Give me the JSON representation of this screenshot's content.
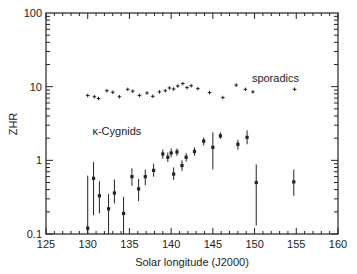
{
  "chart_data": {
    "type": "scatter",
    "title": "",
    "xlabel": "Solar longitude (J2000)",
    "ylabel": "ZHR",
    "xlim": [
      125,
      160
    ],
    "ylim": [
      0.1,
      100
    ],
    "yscale": "log",
    "x_ticks": [
      "125",
      "130",
      "135",
      "140",
      "145",
      "150",
      "155",
      "160"
    ],
    "y_ticks": [
      "0.1",
      "1",
      "10",
      "100"
    ],
    "grid": false,
    "legend": null,
    "annotations": [
      {
        "text": "sporadics",
        "x": 152.5,
        "y": 11.5
      },
      {
        "text": "κ-Cygnids",
        "x": 133.5,
        "y": 2.2
      }
    ],
    "series": [
      {
        "name": "sporadics",
        "marker": "plus",
        "points": [
          {
            "x": 130.0,
            "y": 7.6
          },
          {
            "x": 130.8,
            "y": 7.3
          },
          {
            "x": 131.3,
            "y": 6.9
          },
          {
            "x": 132.3,
            "y": 8.8
          },
          {
            "x": 133.0,
            "y": 8.4
          },
          {
            "x": 133.8,
            "y": 7.3
          },
          {
            "x": 134.8,
            "y": 9.2
          },
          {
            "x": 135.4,
            "y": 8.7
          },
          {
            "x": 136.2,
            "y": 7.6
          },
          {
            "x": 137.1,
            "y": 8.2
          },
          {
            "x": 137.8,
            "y": 7.4
          },
          {
            "x": 138.6,
            "y": 8.5
          },
          {
            "x": 139.3,
            "y": 8.8
          },
          {
            "x": 139.8,
            "y": 9.6
          },
          {
            "x": 140.3,
            "y": 9.3
          },
          {
            "x": 140.8,
            "y": 10.2
          },
          {
            "x": 141.4,
            "y": 11.0
          },
          {
            "x": 141.9,
            "y": 9.7
          },
          {
            "x": 142.4,
            "y": 10.3
          },
          {
            "x": 143.2,
            "y": 9.4
          },
          {
            "x": 144.6,
            "y": 8.3
          },
          {
            "x": 146.2,
            "y": 7.1
          },
          {
            "x": 147.8,
            "y": 10.5
          },
          {
            "x": 148.9,
            "y": 9.2
          },
          {
            "x": 149.8,
            "y": 8.5
          },
          {
            "x": 154.8,
            "y": 9.2
          }
        ]
      },
      {
        "name": "κ-Cygnids",
        "marker": "dot-with-errorbar",
        "points": [
          {
            "x": 130.0,
            "y": 0.12,
            "ylo": 0.1,
            "yhi": 0.62
          },
          {
            "x": 130.7,
            "y": 0.57,
            "ylo": 0.18,
            "yhi": 0.95
          },
          {
            "x": 131.4,
            "y": 0.33,
            "ylo": 0.19,
            "yhi": 0.52
          },
          {
            "x": 132.5,
            "y": 0.22,
            "ylo": 0.1,
            "yhi": 0.35
          },
          {
            "x": 133.2,
            "y": 0.36,
            "ylo": 0.26,
            "yhi": 0.55
          },
          {
            "x": 134.3,
            "y": 0.19,
            "ylo": 0.1,
            "yhi": 0.32
          },
          {
            "x": 135.3,
            "y": 0.6,
            "ylo": 0.45,
            "yhi": 0.78
          },
          {
            "x": 136.1,
            "y": 0.41,
            "ylo": 0.28,
            "yhi": 0.56
          },
          {
            "x": 136.9,
            "y": 0.6,
            "ylo": 0.46,
            "yhi": 0.75
          },
          {
            "x": 137.9,
            "y": 0.73,
            "ylo": 0.6,
            "yhi": 0.9
          },
          {
            "x": 139.0,
            "y": 1.22,
            "ylo": 1.05,
            "yhi": 1.4
          },
          {
            "x": 139.6,
            "y": 1.1,
            "ylo": 0.95,
            "yhi": 1.28
          },
          {
            "x": 140.0,
            "y": 1.26,
            "ylo": 1.1,
            "yhi": 1.45
          },
          {
            "x": 140.3,
            "y": 0.65,
            "ylo": 0.54,
            "yhi": 0.8
          },
          {
            "x": 140.7,
            "y": 1.3,
            "ylo": 1.15,
            "yhi": 1.45
          },
          {
            "x": 141.3,
            "y": 0.85,
            "ylo": 0.72,
            "yhi": 1.0
          },
          {
            "x": 141.8,
            "y": 1.1,
            "ylo": 0.96,
            "yhi": 1.25
          },
          {
            "x": 142.8,
            "y": 1.32,
            "ylo": 1.16,
            "yhi": 1.5
          },
          {
            "x": 143.9,
            "y": 1.82,
            "ylo": 1.6,
            "yhi": 2.05
          },
          {
            "x": 145.0,
            "y": 1.5,
            "ylo": 0.75,
            "yhi": 2.4
          },
          {
            "x": 145.9,
            "y": 2.15,
            "ylo": 1.95,
            "yhi": 2.4
          },
          {
            "x": 148.0,
            "y": 1.65,
            "ylo": 1.4,
            "yhi": 1.9
          },
          {
            "x": 149.1,
            "y": 2.05,
            "ylo": 1.65,
            "yhi": 2.55
          },
          {
            "x": 150.2,
            "y": 0.5,
            "ylo": 0.13,
            "yhi": 0.88
          },
          {
            "x": 154.7,
            "y": 0.51,
            "ylo": 0.33,
            "yhi": 0.75
          }
        ]
      }
    ]
  },
  "layout": {
    "plot_left": 46,
    "plot_right": 338,
    "plot_top": 13,
    "plot_bottom": 234,
    "color": "#222222"
  }
}
